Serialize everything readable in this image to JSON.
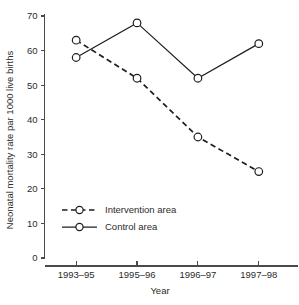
{
  "chart_data": {
    "type": "line",
    "title": "",
    "xlabel": "Year",
    "ylabel": "Neonatal mortality rate par 1000 live births",
    "categories": [
      "1993–95",
      "1995–96",
      "1996–97",
      "1997–98"
    ],
    "ylim": [
      0,
      70
    ],
    "yticks": [
      0,
      10,
      20,
      30,
      40,
      50,
      60,
      70
    ],
    "ytick_labels": [
      "0",
      "10",
      "20",
      "30",
      "40",
      "50",
      "60",
      "70"
    ],
    "grid": false,
    "legend_position": "lower-left inside axes",
    "series": [
      {
        "name": "Intervention area",
        "values": [
          63,
          52,
          35,
          25
        ],
        "line_style": "dashed",
        "marker": "open-circle",
        "color": "#1e1e1e"
      },
      {
        "name": "Control area",
        "values": [
          58,
          68,
          52,
          62
        ],
        "line_style": "solid",
        "marker": "open-circle",
        "color": "#1e1e1e"
      }
    ]
  },
  "legend": {
    "entries": [
      {
        "label": "Intervention area"
      },
      {
        "label": "Control area"
      }
    ]
  },
  "caption": {
    "text": ""
  }
}
